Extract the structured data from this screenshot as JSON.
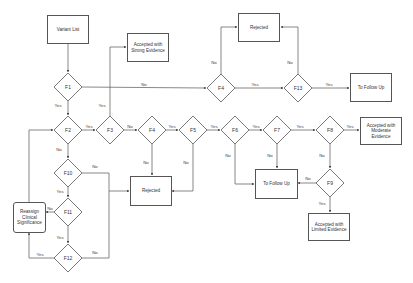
{
  "diagram": {
    "boxes": {
      "variant_list": "Variant List",
      "accepted_strong": "Accepted with Strong Evidence",
      "rejected_top": "Rejected",
      "follow_up_right": "To Follow Up",
      "accepted_moderate": "Accepted with Moderate Evidence",
      "rejected_mid": "Rejected",
      "follow_up_mid": "To Follow Up",
      "accepted_limited": "Accepted with Limited Evidence",
      "reassign": "Reassign Clinical Significance"
    },
    "decisions": {
      "f1": "F1",
      "f2": "F2",
      "f3": "F3",
      "f4_row2": "F4",
      "f5": "F5",
      "f6": "F6",
      "f7": "F7",
      "f8": "F8",
      "f9": "F9",
      "f10": "F10",
      "f11": "F11",
      "f12": "F12",
      "f4_top": "F4",
      "f13": "F13"
    },
    "edge_labels": {
      "f1_yes": "Yes",
      "f1_no": "No",
      "f4top_no": "No",
      "f4top_yes": "Yes",
      "f13_no": "No",
      "f13_yes": "Yes",
      "f2_yes": "Yes",
      "f2_no": "No",
      "f3_yes": "Yes",
      "f3_no": "No",
      "f4_yes": "Yes",
      "f4_no": "No",
      "f5_yes": "Yes",
      "f5_no": "No",
      "f6_yes": "Yes",
      "f6_no": "No",
      "f7_yes": "Yes",
      "f7_no": "No",
      "f8_yes": "Yes",
      "f8_no": "No",
      "f9_no": "No",
      "f9_yes": "Yes",
      "f10_no": "No",
      "f10_yes": "Yes",
      "f11_no": "No",
      "f11_yes": "Yes",
      "f12_yes": "Yes",
      "f12_no": "No"
    },
    "colors": {
      "stroke": "#555555",
      "text": "#333333",
      "background": "#ffffff"
    }
  }
}
